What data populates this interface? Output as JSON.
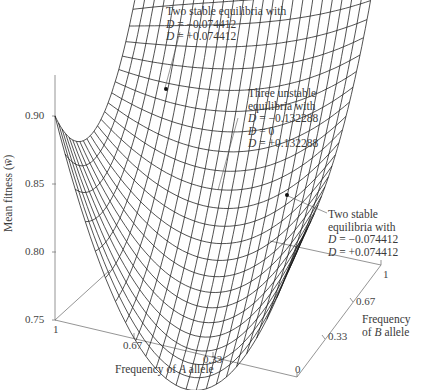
{
  "chart_data": {
    "type": "surface3d",
    "title": "",
    "zlabel": "Mean fitness (w̄)",
    "xlabel": "Frequency of A allele",
    "ylabel": "Frequency of B allele",
    "zlim": [
      0.75,
      0.93
    ],
    "z_ticks": [
      "0.90",
      "0.85",
      "0.80",
      "0.75"
    ],
    "x_ticks": [
      "1",
      "0.67",
      "0.33",
      "0"
    ],
    "y_ticks": [
      "0",
      "0.33",
      "0.67",
      "1"
    ],
    "grid": false,
    "surface_description": "Wireframe mesh of mean fitness over allele frequencies; saddle-shaped with two raised corner peaks and a deep trough near A≈0.5, B≈0",
    "annotations": [
      {
        "text": [
          "Two stable equilibria with",
          "D = −0.074412",
          "D = +0.074412"
        ],
        "marker": "dot"
      },
      {
        "text": [
          "Three unstable",
          "equilibria with",
          "D = −0.132288",
          "D = 0",
          "D = +0.132288"
        ],
        "marker": "none"
      },
      {
        "text": [
          "Two stable",
          "equilibria with",
          "D = −0.074412",
          "D = +0.074412"
        ],
        "marker": "dot"
      }
    ]
  },
  "axes": {
    "z_label_prefix": "Mean fitness (",
    "z_label_symbol": "w̄",
    "z_label_suffix": ")",
    "z_ticks": [
      "0.90",
      "0.85",
      "0.80",
      "0.75"
    ],
    "a_ticks": [
      "1",
      "0.67",
      "0.33",
      "0"
    ],
    "b_ticks": [
      "0.33",
      "0.67",
      "1"
    ],
    "a_label_pre": "Frequency of ",
    "a_label_var": "A",
    "a_label_post": " allele",
    "b_label_line1": "Frequency",
    "b_label_pre": "of ",
    "b_label_var": "B",
    "b_label_post": " allele"
  },
  "annotations": {
    "top": {
      "line1": "Two stable equilibria with",
      "d1_var": "D",
      "d1_val": " = −0.074412",
      "d2_var": "D",
      "d2_val": " = +0.074412"
    },
    "middle": {
      "line1": "Three unstable",
      "line2": "equilibria with",
      "d1_var": "D",
      "d1_val": " = −0.132288",
      "d2_var": "D",
      "d2_val": " = 0",
      "d3_var": "D",
      "d3_val": " = +0.132288"
    },
    "right": {
      "line1": "Two stable",
      "line2": "equilibria with",
      "d1_var": "D",
      "d1_val": " = −0.074412",
      "d2_var": "D",
      "d2_val": " = +0.074412"
    }
  },
  "colors": {
    "mesh": "#1a1a1a",
    "axis": "#777777",
    "text": "#3a3a3a"
  }
}
